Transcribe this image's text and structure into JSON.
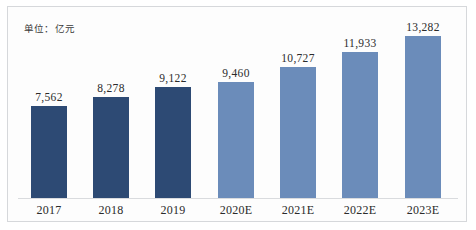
{
  "unit_note": "单位：亿元",
  "chart_data": {
    "type": "bar",
    "title": "",
    "subtitle": "",
    "xlabel": "",
    "ylabel": "",
    "unit": "亿元",
    "grid": false,
    "legend": "none",
    "ylim": [
      0,
      14000
    ],
    "categories": [
      "2017",
      "2018",
      "2019",
      "2020E",
      "2021E",
      "2022E",
      "2023E"
    ],
    "values": [
      7562,
      8278,
      9122,
      9460,
      10727,
      11933,
      13282
    ],
    "value_labels": [
      "7,562",
      "8,278",
      "9,122",
      "9,460",
      "10,727",
      "11,933",
      "13,282"
    ],
    "series": [
      {
        "name": "",
        "values": [
          7562,
          8278,
          9122,
          9460,
          10727,
          11933,
          13282
        ],
        "point_kinds": [
          "actual",
          "actual",
          "actual",
          "estimate",
          "estimate",
          "estimate",
          "estimate"
        ]
      }
    ],
    "colors": {
      "actual": "#2d4a74",
      "estimate": "#6b8cba",
      "axis": "#d9dbde",
      "frame": "#d6d8db",
      "text": "#2b2b2b",
      "background": "#fdfdfd"
    }
  }
}
